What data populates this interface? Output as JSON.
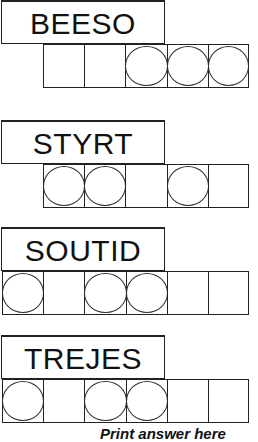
{
  "puzzles": [
    {
      "scrambled": "BEESO",
      "circled": [
        false,
        false,
        true,
        true,
        true
      ]
    },
    {
      "scrambled": "STYRT",
      "circled": [
        true,
        true,
        false,
        true,
        false
      ]
    },
    {
      "scrambled": "SOUTID",
      "circled": [
        true,
        false,
        true,
        true,
        false,
        false
      ]
    },
    {
      "scrambled": "TREJES",
      "circled": [
        true,
        false,
        true,
        true,
        false,
        false
      ]
    }
  ],
  "footer": {
    "instruction": "Print answer here"
  }
}
